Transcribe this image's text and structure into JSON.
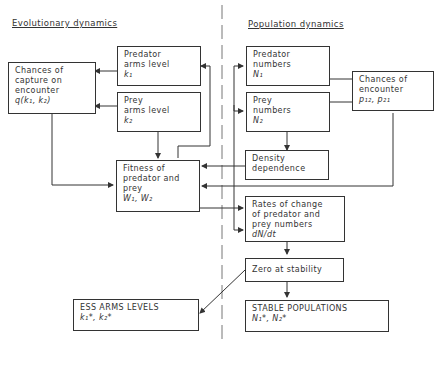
{
  "sections": {
    "left_title": "Evolutionary dynamics",
    "right_title": "Population dynamics"
  },
  "boxes": {
    "chances_capture": {
      "lines": [
        "Chances of",
        "capture on",
        "encounter"
      ],
      "symbol": "q(k₁, k₂)"
    },
    "predator_arms": {
      "lines": [
        "Predator",
        "arms level"
      ],
      "symbol": "k₁"
    },
    "prey_arms": {
      "lines": [
        "Prey",
        "arms level"
      ],
      "symbol": "k₂"
    },
    "fitness": {
      "lines": [
        "Fitness of",
        "predator and",
        "prey"
      ],
      "symbol": "W₁, W₂"
    },
    "predator_numbers": {
      "lines": [
        "Predator",
        "numbers"
      ],
      "symbol": "N₁"
    },
    "prey_numbers": {
      "lines": [
        "Prey",
        "numbers"
      ],
      "symbol": "N₂"
    },
    "chances_encounter": {
      "lines": [
        "Chances of",
        "encounter"
      ],
      "symbol": "p₁₂, p₂₁"
    },
    "density": {
      "lines": [
        "Density",
        "dependence"
      ]
    },
    "rates": {
      "lines": [
        "Rates of change",
        "of predator and",
        "prey numbers"
      ],
      "symbol": "dN/dt"
    },
    "zero": {
      "lines": [
        "Zero at stability"
      ]
    },
    "ess": {
      "lines": [
        "ESS ARMS LEVELS"
      ],
      "symbol": "k₁*, k₂*"
    },
    "stable": {
      "lines": [
        "STABLE POPULATIONS"
      ],
      "symbol": "N₁*, N₂*"
    }
  }
}
